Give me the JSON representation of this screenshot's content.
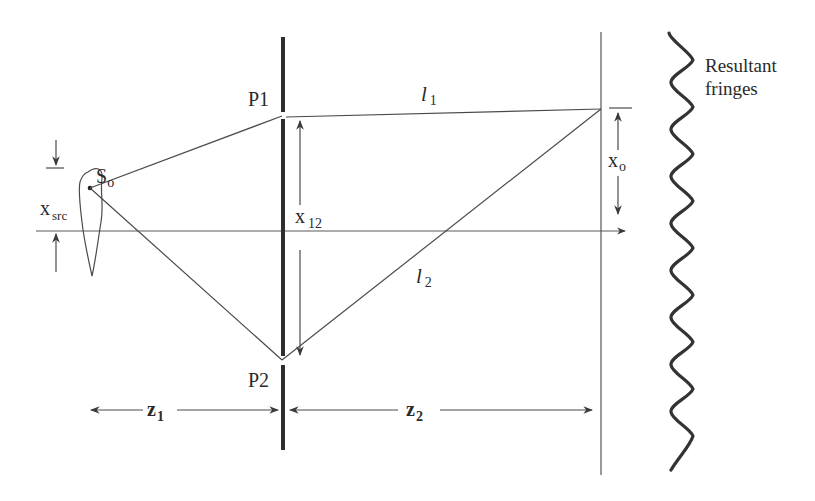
{
  "diagram": {
    "labels": {
      "source": "S",
      "source_sub": "o",
      "x_src": "x",
      "x_src_sub": "src",
      "pinhole1": "P1",
      "pinhole2": "P2",
      "x12": "x",
      "x12_sub": "12",
      "l1": "l",
      "l1_sub": "1",
      "l2": "l",
      "l2_sub": "2",
      "xo": "x",
      "xo_sub": "o",
      "z1": "z",
      "z1_sub": "1",
      "z2": "z",
      "z2_sub": "2",
      "fringes_line1": "Resultant",
      "fringes_line2": "fringes"
    },
    "colors": {
      "line": "#4a4a4a",
      "barrier": "#2e2e2e",
      "fringe": "#333333",
      "text": "#2a2a2a"
    }
  }
}
